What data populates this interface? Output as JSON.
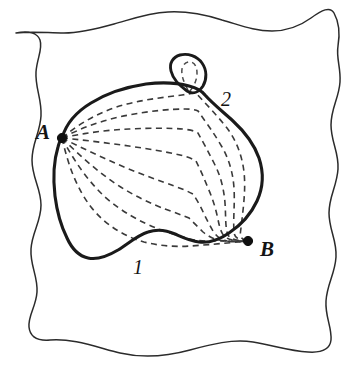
{
  "figure": {
    "kind": "hand-drawn-topology-diagram",
    "background_color": "#ffffff",
    "ink_color": "#1a1a1a",
    "dashed_ink_color": "#3a3a3a",
    "frame_ink_color": "#2b2b2b"
  },
  "labels": {
    "point_a": "A",
    "point_b": "B",
    "arc_one": "1",
    "arc_two": "2"
  },
  "label_positions": {
    "point_a": {
      "x": 43,
      "y": 134
    },
    "point_b": {
      "x": 267,
      "y": 251
    },
    "arc_one": {
      "x": 138,
      "y": 269
    },
    "arc_two": {
      "x": 226,
      "y": 101
    }
  },
  "vertices": [
    {
      "name": "A",
      "x": 62,
      "y": 138,
      "radius": 4.6
    },
    {
      "name": "B",
      "x": 248,
      "y": 241,
      "radius": 4.6
    }
  ],
  "counts": {
    "dashed_homotopy_curves": 8,
    "boundary_arcs": 2,
    "loops": 1,
    "marked_points": 2
  },
  "paths": {
    "outer_frame": "M 16 33 C 30 30 38 34 40 40 C 43 49 37 58 36 72 C 35 88 42 99 41 116 C 40 133 32 143 32 160 C 32 178 41 188 41 205 C 41 222 32 232 31 249 C 30 266 38 276 37 292 C 36 307 28 315 29 327 C 30 337 38 341 50 340 C 72 338 96 347 120 353 C 146 359 168 356 190 350 C 212 344 232 339 253 342 C 272 345 290 351 308 352 C 322 353 330 349 331 340 C 332 327 325 317 326 301 C 327 284 335 274 336 257 C 337 240 329 230 329 213 C 329 196 337 186 338 169 C 339 152 331 142 331 125 C 331 108 339 98 340 82 C 341 68 336 58 338 46 C 340 34 339 22 334 13 C 330 6 322 10 311 18 C 300 26 288 31 272 31 C 254 31 240 25 222 20 C 203 14 186 11 168 12 C 148 13 132 19 114 24 C 96 29 80 33 64 33 C 48 33 32 31 16 33 Z",
    "region_outline": "M 62 138 C 66 124 76 112 91 103 C 107 93 126 87 146 84 C 163 82 178 83 189 86 C 197 88 202 91 205 95 C 212 103 222 111 233 121 C 245 132 254 144 259 158 C 264 173 263 188 257 201 C 251 214 241 225 229 233 C 219 240 208 243 199 242 C 190 241 182 237 175 234 C 166 230 157 229 148 232 C 138 235 129 243 118 250 C 108 256 97 260 88 258 C 79 256 72 249 67 238 C 61 226 57 212 55 196 C 53 179 54 160 58 147 C 59 143 60 140 62 138 Z",
    "loop_outline": "M 187 91 C 180 86 173 79 171 71 C 169 63 173 57 180 55 C 188 53 197 56 202 63 C 207 70 207 79 203 86 C 199 92 193 95 187 91 Z",
    "loop_inner_dashed": "M 188 90 C 184 83 181 75 182 69 C 183 64 187 61 191 62 C 195 63 197 67 197 73 C 197 80 194 86 190 91",
    "homotopy_curves": [
      "M 62 138 C 82 121 104 110 127 104 C 147 99 167 97 182 95 C 189 94 193 93 196 93 C 204 102 216 114 227 128 C 236 140 242 155 244 172 C 246 190 243 210 241 228 C 240 235 239 239 248 241",
      "M 62 138 C 83 127 106 119 129 115 C 150 111 170 109 185 109 C 192 109 196 110 198 111 C 205 121 214 133 222 147 C 229 159 233 173 234 188 C 235 204 233 219 234 231 C 234 237 237 240 248 241",
      "M 62 138 C 84 133 107 130 129 129 C 150 128 169 128 183 129 C 191 130 195 131 198 133 C 203 142 209 153 215 165 C 221 177 224 190 225 203 C 226 216 225 228 228 235 C 231 240 238 241 248 241",
      "M 62 138 C 84 140 107 143 129 146 C 149 149 167 152 180 155 C 188 157 193 159 196 161 C 200 169 204 178 208 188 C 212 197 215 206 217 215 C 219 224 220 231 224 236 C 229 241 239 241 248 241",
      "M 62 138 C 82 148 103 158 124 167 C 143 175 161 181 174 186 C 183 189 189 192 193 194 C 197 200 201 207 204 214 C 207 220 210 226 213 231 C 217 237 221 240 227 241 C 235 242 242 241 248 241",
      "M 62 138 C 79 155 97 171 116 184 C 134 196 152 204 165 209 C 176 213 184 216 189 218 C 194 223 199 228 203 232 C 208 236 213 239 219 240 C 228 242 240 242 248 241",
      "M 62 138 C 74 161 88 181 105 197 C 122 212 141 222 156 228 C 169 233 179 236 186 238 C 193 240 200 241 208 241 C 221 241 237 241 248 241",
      "M 62 138 C 68 165 77 189 91 207 C 106 226 126 237 144 242 C 160 246 175 247 190 246 C 207 245 226 243 238 242 C 244 241 247 241 248 241"
    ]
  }
}
